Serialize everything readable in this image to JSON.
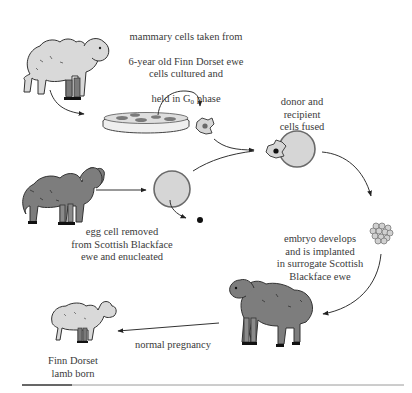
{
  "diagram": {
    "colors": {
      "background": "#ffffff",
      "finn_dorset_wool": "#d9d9d9",
      "blackface_wool": "#7d7d7d",
      "cell_fill": "#d6d6d6",
      "cell_outline": "#6a6a6a",
      "line": "#333333",
      "text": "#3a3a3a",
      "rule": "#9a9a9a"
    },
    "labels": {
      "mammary_line1": "mammary cells taken from",
      "mammary_line2": "6-year old Finn Dorset ewe",
      "cultured_line1": "cells cultured and",
      "cultured_line2_prefix": "held in G",
      "cultured_subscript": "0",
      "cultured_line2_suffix": " phase",
      "fused": "donor and\nrecipient\ncells fused",
      "egg": "egg cell removed\nfrom Scottish Blackface\newe and enucleated",
      "embryo": "embryo develops\nand is implanted\nin surrogate Scottish\nBlackface ewe",
      "pregnancy": "normal pregnancy",
      "lamb": "Finn Dorset\nlamb born"
    },
    "nodes": [
      {
        "id": "finn-dorset-ewe",
        "type": "sheep",
        "shade": "light"
      },
      {
        "id": "petri-dish",
        "type": "culture dish"
      },
      {
        "id": "donor-cell",
        "type": "cell"
      },
      {
        "id": "blackface-ewe",
        "type": "sheep",
        "shade": "dark"
      },
      {
        "id": "egg-cell",
        "type": "cell"
      },
      {
        "id": "removed-nucleus",
        "type": "nucleus"
      },
      {
        "id": "fused-cell",
        "type": "cell"
      },
      {
        "id": "embryo",
        "type": "cell cluster"
      },
      {
        "id": "surrogate-ewe",
        "type": "sheep",
        "shade": "dark"
      },
      {
        "id": "lamb",
        "type": "sheep",
        "shade": "light"
      }
    ],
    "edges": [
      {
        "from": "finn-dorset-ewe",
        "to": "petri-dish"
      },
      {
        "from": "petri-dish",
        "to": "donor-cell"
      },
      {
        "from": "donor-cell",
        "to": "fused-cell"
      },
      {
        "from": "blackface-ewe",
        "to": "egg-cell"
      },
      {
        "from": "egg-cell",
        "to": "removed-nucleus"
      },
      {
        "from": "egg-cell",
        "to": "fused-cell"
      },
      {
        "from": "fused-cell",
        "to": "embryo"
      },
      {
        "from": "embryo",
        "to": "surrogate-ewe"
      },
      {
        "from": "surrogate-ewe",
        "to": "lamb",
        "label": "normal pregnancy"
      }
    ]
  }
}
